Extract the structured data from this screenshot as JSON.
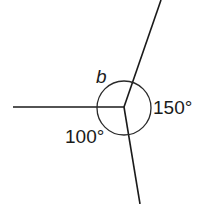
{
  "diagram": {
    "type": "angles-at-a-point",
    "labels": {
      "unknown_angle": "b",
      "right_angle": "150°",
      "lower_left_angle": "100°"
    },
    "angles": [
      {
        "name": "b",
        "between": [
          "left-ray",
          "upper-ray"
        ],
        "value": null
      },
      {
        "name": "150°",
        "between": [
          "upper-ray",
          "lower-ray"
        ],
        "value": 150
      },
      {
        "name": "100°",
        "between": [
          "lower-ray",
          "left-ray"
        ],
        "value": 100
      }
    ],
    "colors": {
      "line": "#1a1a1a",
      "background": "#ffffff"
    }
  }
}
